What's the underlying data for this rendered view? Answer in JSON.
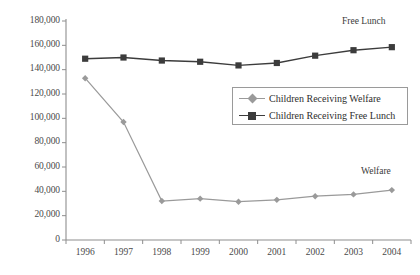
{
  "chart_data": {
    "type": "line",
    "title": "",
    "xlabel": "",
    "ylabel": "",
    "categories": [
      "1996",
      "1997",
      "1998",
      "1999",
      "2000",
      "2001",
      "2002",
      "2003",
      "2004"
    ],
    "x": [
      1996,
      1997,
      1998,
      1999,
      2000,
      2001,
      2002,
      2003,
      2004
    ],
    "ylim": [
      0,
      180000
    ],
    "ytick_labels": [
      "180,000",
      "160,000",
      "140,000",
      "120,000",
      "100,000",
      "80,000",
      "60,000",
      "40,000",
      "20,000",
      "0"
    ],
    "ytick_values": [
      180000,
      160000,
      140000,
      120000,
      100000,
      80000,
      60000,
      40000,
      20000,
      0
    ],
    "grid": false,
    "legend_position": "center-right",
    "series": [
      {
        "name": "Children Receiving Welfare",
        "short_name": "Welfare",
        "color": "#9a9a9a",
        "marker": "diamond",
        "values": [
          133000,
          97000,
          32000,
          34000,
          31500,
          33000,
          36000,
          37500,
          41000
        ]
      },
      {
        "name": "Children Receiving Free Lunch",
        "short_name": "Free Lunch",
        "color": "#3c3c3c",
        "marker": "square",
        "values": [
          149000,
          150000,
          147500,
          146500,
          143500,
          145500,
          151500,
          156000,
          158500
        ]
      }
    ],
    "annotations": [
      {
        "text": "Free Lunch",
        "series": "Children Receiving Free Lunch"
      },
      {
        "text": "Welfare",
        "series": "Children Receiving Welfare"
      }
    ],
    "legend": {
      "entries": [
        {
          "label": "Children Receiving Welfare",
          "marker": "diamond",
          "color": "#9a9a9a"
        },
        {
          "label": "Children Receiving Free Lunch",
          "marker": "square",
          "color": "#3c3c3c"
        }
      ]
    },
    "axis_color": "#8e8e8e"
  }
}
